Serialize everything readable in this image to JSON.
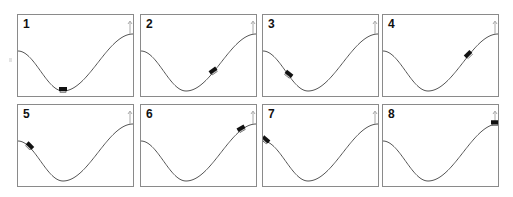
{
  "figure": {
    "panel_count": 8,
    "colors": {
      "curve": "#555555",
      "car": "#111111",
      "flag": "#aaaaaa",
      "border": "#8a8a8a",
      "label": "#111111"
    }
  },
  "panels": [
    {
      "label": "1",
      "car": {
        "x": 45,
        "angle": 0
      }
    },
    {
      "label": "2",
      "car": {
        "x": 72,
        "angle": -35
      }
    },
    {
      "label": "3",
      "car": {
        "x": 26,
        "angle": 38
      }
    },
    {
      "label": "4",
      "car": {
        "x": 85,
        "angle": -45
      }
    },
    {
      "label": "5",
      "car": {
        "x": 12,
        "angle": 45
      }
    },
    {
      "label": "6",
      "car": {
        "x": 100,
        "angle": -30
      }
    },
    {
      "label": "7",
      "car": {
        "x": 3,
        "angle": 40
      }
    },
    {
      "label": "8",
      "car": {
        "x": 112,
        "angle": 0
      }
    }
  ]
}
